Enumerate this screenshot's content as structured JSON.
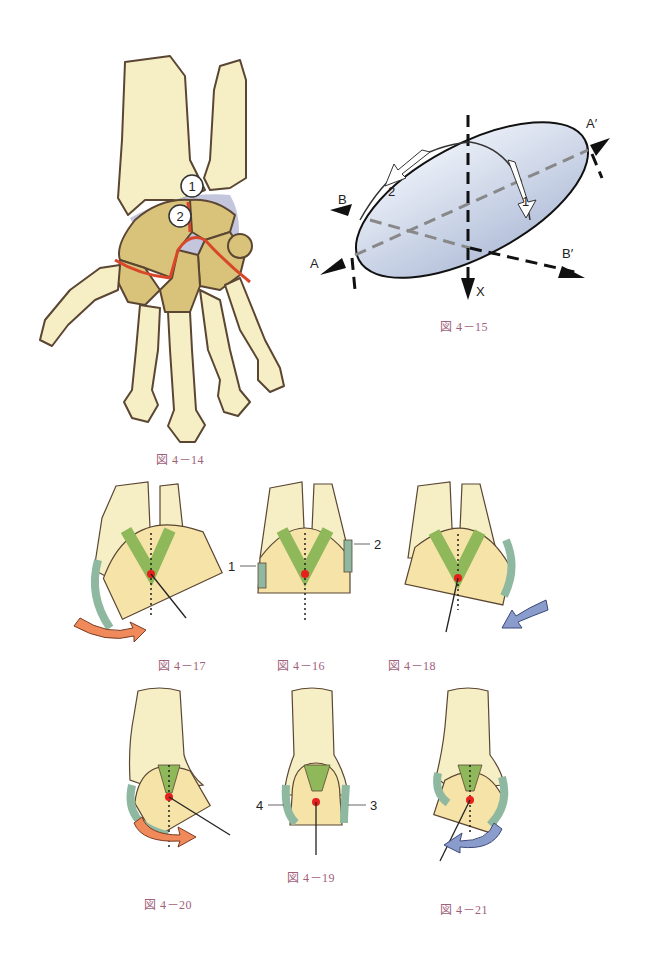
{
  "figures": {
    "fig_4_14": {
      "caption": "図 4－14",
      "markers": [
        "1",
        "2"
      ]
    },
    "fig_4_15": {
      "caption": "図 4－15",
      "axis_labels": {
        "a": "A",
        "a_prime": "A′",
        "b": "B",
        "b_prime": "B′",
        "x": "X"
      },
      "arrow_labels": [
        "1",
        "2"
      ]
    },
    "fig_4_16": {
      "caption": "図 4－16",
      "labels": [
        "1",
        "2"
      ]
    },
    "fig_4_17": {
      "caption": "図 4－17"
    },
    "fig_4_18": {
      "caption": "図 4－18"
    },
    "fig_4_19": {
      "caption": "図 4－19",
      "labels": [
        "4",
        "3"
      ]
    },
    "fig_4_20": {
      "caption": "図 4－20"
    },
    "fig_4_21": {
      "caption": "図 4－21"
    }
  },
  "colors": {
    "bone": "#f6efc6",
    "bone_outline": "#5a4632",
    "carpal": "#d9c27a",
    "joint_line": "#d9472a",
    "capsule_shadow": "#c4c6de",
    "ligament": "#8fb85a",
    "cartilage": "#8fb8a0",
    "rotation_center": "#e8201c",
    "arrow_orange": "#f08a5a",
    "arrow_blue": "#8a9ccc",
    "ellipsoid": "#c9d3e6",
    "caption": "#a0607a"
  }
}
